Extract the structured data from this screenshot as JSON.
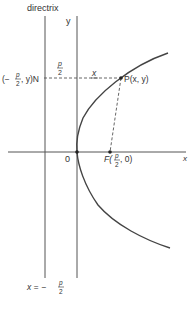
{
  "diagram": {
    "labels": {
      "directrix": "directrix",
      "y_axis": "y",
      "x_axis": "x",
      "origin": "0",
      "point_n_prefix": "(−",
      "point_n_suffix": ", y)N",
      "p_over_2_num": "p",
      "p_over_2_den": "2",
      "segment_x": "x",
      "point_p": "P(x, y)",
      "focus_prefix": "F(",
      "focus_suffix": ", 0)",
      "directrix_eq_prefix": "x = −"
    },
    "colors": {
      "line": "#555555",
      "curve": "#444444",
      "text": "#333333"
    }
  }
}
